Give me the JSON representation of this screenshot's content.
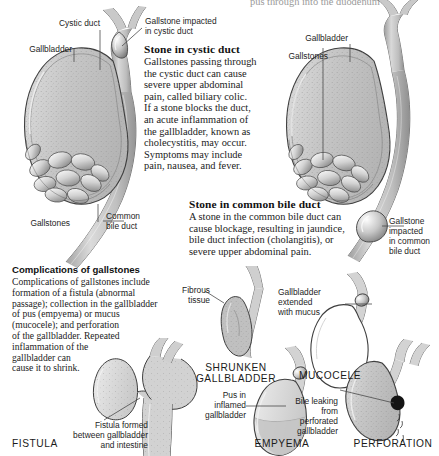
{
  "figure": {
    "title_clipped_top": "pus through into the duodenum"
  },
  "top_left_diagram": {
    "labels": {
      "cystic_duct": "Cystic duct",
      "gallbladder": "Gallbladder",
      "gallstones": "Gallstones",
      "common_bile_duct": "Common\nbile duct",
      "impacted": "Gallstone impacted\nin cystic duct"
    }
  },
  "top_right_diagram": {
    "labels": {
      "gallbladder": "Gallbladder",
      "gallstones": "Gallstones",
      "impacted_cbd": "Gallstone\nimpacted\nin common\nbile duct"
    }
  },
  "section_cystic": {
    "heading": "Stone in cystic duct",
    "body": "Gallstones passing through\nthe cystic duct can cause\nsevere upper abdominal\npain, called biliary colic.\nIf a stone blocks the duct,\nan acute inflammation of\nthe gallbladder, known as\ncholecystitis, may occur.\nSymptoms may include\npain, nausea, and fever."
  },
  "section_cbd": {
    "heading": "Stone in common bile duct",
    "body": "A stone in the common bile duct can\ncause blockage, resulting in jaundice,\nbile duct infection (cholangitis), or\nsevere upper abdominal pain."
  },
  "section_complications": {
    "heading": "Complications of gallstones",
    "body": "Complications of gallstones include\nformation of a fistula (abnormal\npassage); collection in the gallbladder\nof pus (empyema) or mucus\n(mucocele); and perforation\nof the gallbladder. Repeated\ninflammation of the\ngallbladder can\ncause it to shrink."
  },
  "complication_figures": [
    {
      "id": "shrunken",
      "caption": "SHRUNKEN\nGALLBLADDER",
      "callout": "Fibrous\ntissue"
    },
    {
      "id": "mucocele",
      "caption": "MUCOCELE",
      "callout": "Gallbladder\nextended\nwith mucus"
    },
    {
      "id": "fistula",
      "caption": "FISTULA",
      "callout": "Fistula formed\nbetween gallbladder\nand intestine"
    },
    {
      "id": "empyema",
      "caption": "EMPYEMA",
      "callout": "Pus in\ninflamed\ngallbladder"
    },
    {
      "id": "perforation",
      "caption": "PERFORATION",
      "callout": "Bile leaking\nfrom\nperforated\ngallbladder"
    }
  ],
  "colors": {
    "organ_fill": "#c9c9c9",
    "organ_fill_light": "#dcdcdc",
    "organ_outline": "#4a4a4a",
    "duct_fill": "#b9b9b9",
    "stone_fill": "#efefef",
    "stone_shade": "#8f8f8f",
    "text": "#1b1b1b",
    "leader": "#4a4a4a",
    "background": "#ffffff"
  }
}
